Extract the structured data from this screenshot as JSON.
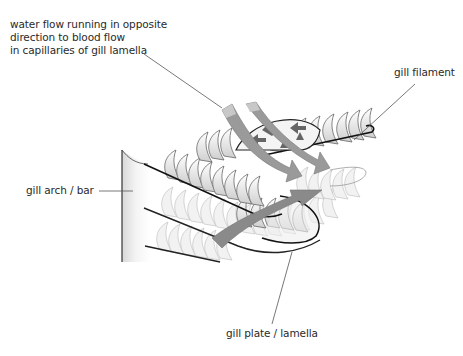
{
  "diagram": {
    "labels": {
      "water_flow": [
        "water flow running in opposite",
        "direction to blood flow",
        "in capillaries of gill lamella"
      ],
      "gill_filament": "gill filament",
      "gill_arch": "gill arch / bar",
      "gill_plate": "gill plate / lamella"
    },
    "colors": {
      "outline": "#1a1a1a",
      "leader_line": "#555555",
      "arrow_fill": "#8a8a8a",
      "water_arrow_fill": "#c8c8c8",
      "lamella_fill": "#e6e6e6",
      "text": "#2a2a2a"
    }
  }
}
